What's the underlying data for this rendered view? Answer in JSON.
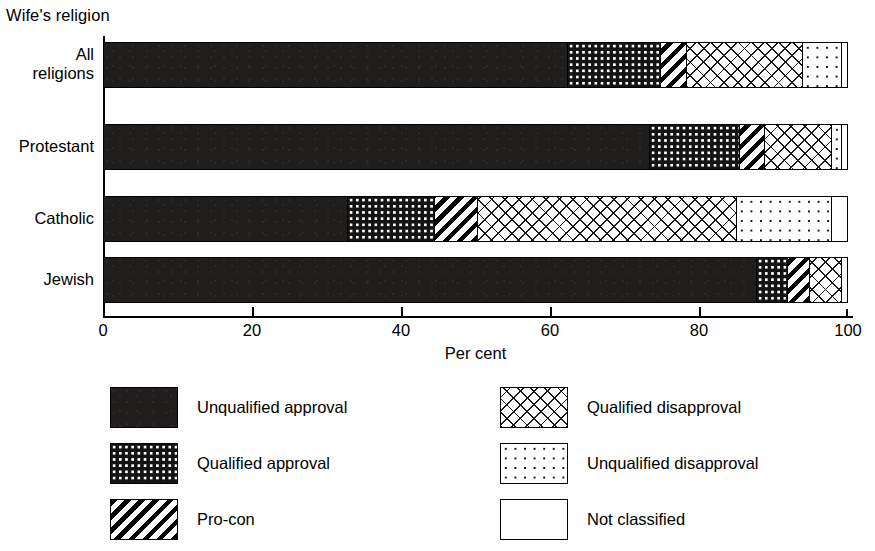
{
  "chart_data": {
    "type": "bar",
    "orientation": "horizontal",
    "stacked": true,
    "title": "",
    "group_title": "Wife's religion",
    "xlabel": "Per cent",
    "ylabel": "",
    "xlim": [
      0,
      100
    ],
    "xticks": [
      0,
      20,
      40,
      60,
      80,
      100
    ],
    "xtick_labels": [
      "0",
      "20",
      "40",
      "60",
      "80",
      "100"
    ],
    "grid": false,
    "legend_position": "below",
    "categories": [
      "All religions",
      "Protestant",
      "Catholic",
      "Jewish"
    ],
    "series": [
      {
        "name": "Unqualified approval",
        "values": [
          62.4,
          73.5,
          32.8,
          87.9
        ]
      },
      {
        "name": "Qualified approval",
        "values": [
          12.5,
          12.1,
          11.8,
          4.1
        ]
      },
      {
        "name": "Pro-con",
        "values": [
          3.6,
          3.3,
          5.8,
          3.0
        ]
      },
      {
        "name": "Qualified disapproval",
        "values": [
          15.6,
          9.1,
          34.8,
          4.3
        ]
      },
      {
        "name": "Unqualified disapproval",
        "values": [
          5.2,
          1.3,
          12.8,
          0.0
        ]
      },
      {
        "name": "Not classified",
        "values": [
          0.7,
          0.7,
          2.0,
          0.7
        ]
      }
    ]
  },
  "axis": {
    "group_title": "Wife's religion",
    "xlabel": "Per cent",
    "tick_labels": [
      "0",
      "20",
      "40",
      "60",
      "80",
      "100"
    ]
  },
  "rows": [
    {
      "label_line1": "All",
      "label_line2": "religions"
    },
    {
      "label_line1": "Protestant",
      "label_line2": ""
    },
    {
      "label_line1": "Catholic",
      "label_line2": ""
    },
    {
      "label_line1": "Jewish",
      "label_line2": ""
    }
  ],
  "legend": {
    "left": [
      {
        "label": "Unqualified approval",
        "pattern": "solid-black"
      },
      {
        "label": "Qualified approval",
        "pattern": "dense-dots-on-black"
      },
      {
        "label": "Pro-con",
        "pattern": "diagonal-stripes"
      }
    ],
    "right": [
      {
        "label": "Qualified disapproval",
        "pattern": "crosshatch"
      },
      {
        "label": "Unqualified disapproval",
        "pattern": "sparse-dots"
      },
      {
        "label": "Not classified",
        "pattern": "empty-white"
      }
    ]
  }
}
